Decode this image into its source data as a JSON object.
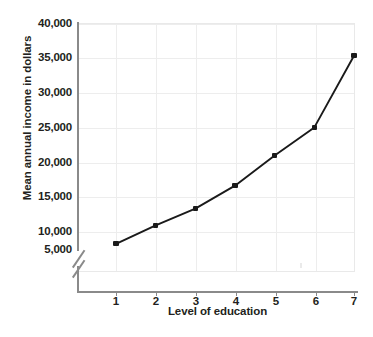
{
  "chart_data": {
    "type": "line",
    "title": "",
    "xlabel": "Level of education",
    "ylabel": "Mean annual income in dollars",
    "x": [
      1,
      2,
      3,
      4,
      5,
      6,
      7
    ],
    "categories": [
      "1",
      "2",
      "3",
      "4",
      "5",
      "6",
      "7"
    ],
    "values": [
      5800,
      8700,
      11300,
      14900,
      19600,
      24000,
      35200
    ],
    "series": [
      {
        "name": "Mean annual income",
        "values": [
          5800,
          8700,
          11300,
          14900,
          19600,
          24000,
          35200
        ]
      }
    ],
    "xtick_labels": [
      "1",
      "2",
      "3",
      "4",
      "5",
      "6",
      "7"
    ],
    "ytick_labels": [
      "5,000",
      "10,000",
      "15,000",
      "20,000",
      "25,000",
      "30,000",
      "35,000",
      "40,000"
    ],
    "ytick_values": [
      5000,
      10000,
      15000,
      20000,
      25000,
      30000,
      35000,
      40000
    ],
    "ylim": [
      5000,
      40000
    ],
    "xlim": [
      1,
      7
    ],
    "grid": true,
    "legend": false,
    "legend_position": "none",
    "axis_break": {
      "axis": "y",
      "below_value": 5000,
      "symbol": "double-slash"
    },
    "marker": "square",
    "line_color": "#1a1a1a",
    "marker_color": "#1a1a1a",
    "grid_color": "#ededed",
    "axis_color": "#8a8a8a",
    "background_color": "#ffffff",
    "text_color": "#231f20"
  }
}
